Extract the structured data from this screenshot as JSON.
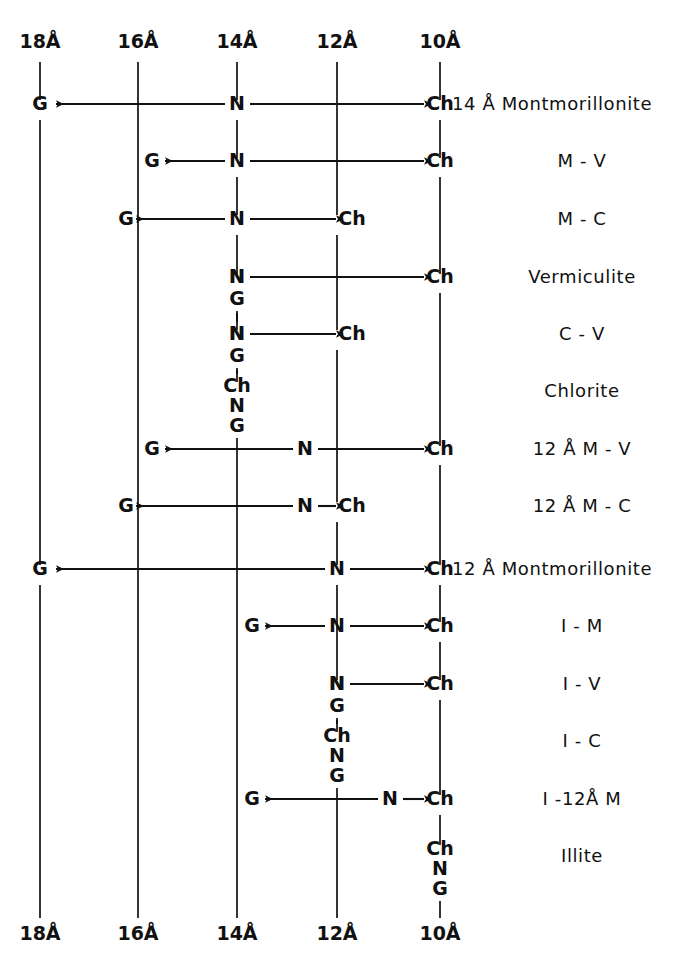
{
  "figure": {
    "background_color": "#ffffff",
    "ink_color": "#111111",
    "width": 687,
    "height": 972
  },
  "axis": {
    "name": "d-spacing columns",
    "top_labels": [
      "18Å",
      "16Å",
      "14Å",
      "12Å",
      "10Å"
    ],
    "bottom_labels": [
      "18Å",
      "16Å",
      "14Å",
      "12Å",
      "10Å"
    ],
    "column_x": [
      40,
      138,
      237,
      337,
      440
    ],
    "top_label_y": 48,
    "bottom_label_y": 940
  },
  "legend_keys": {
    "G": "Glycolated",
    "N": "Natural / air-dried",
    "Ch": "Heated (chlorite test)"
  },
  "rows": [
    {
      "id": "row-14a-montmorillonite",
      "label": "14 Å Montmorillonite",
      "label_x": 452,
      "label_anchor": "start",
      "y": 110,
      "nodes": [
        {
          "text": "G",
          "x": 40,
          "col": "18Å"
        },
        {
          "text": "N",
          "x": 237,
          "col": "14Å"
        },
        {
          "text": "Ch",
          "x": 440,
          "col": "10Å"
        }
      ],
      "arrows": [
        {
          "from_x": 225,
          "to_x": 56,
          "dir": "left"
        },
        {
          "from_x": 250,
          "to_x": 424,
          "dir": "right"
        }
      ]
    },
    {
      "id": "row-m-v",
      "label": "M - V",
      "label_x": 582,
      "label_anchor": "middle",
      "y": 167,
      "nodes": [
        {
          "text": "G",
          "x": 152,
          "col": "16Å"
        },
        {
          "text": "N",
          "x": 237,
          "col": "14Å"
        },
        {
          "text": "Ch",
          "x": 440,
          "col": "10Å"
        }
      ],
      "arrows": [
        {
          "from_x": 225,
          "to_x": 165,
          "dir": "left"
        },
        {
          "from_x": 250,
          "to_x": 424,
          "dir": "right"
        }
      ]
    },
    {
      "id": "row-m-c",
      "label": "M - C",
      "label_x": 582,
      "label_anchor": "middle",
      "y": 225,
      "nodes": [
        {
          "text": "G",
          "x": 126,
          "col": "16Å"
        },
        {
          "text": "N",
          "x": 237,
          "col": "14Å"
        },
        {
          "text": "Ch",
          "x": 352,
          "col": "12Å"
        }
      ],
      "arrows": [
        {
          "from_x": 225,
          "to_x": 136,
          "dir": "left"
        },
        {
          "from_x": 250,
          "to_x": 336,
          "dir": "right"
        }
      ]
    },
    {
      "id": "row-vermiculite",
      "label": "Vermiculite",
      "label_x": 582,
      "label_anchor": "middle",
      "y": 283,
      "nodes": [
        {
          "text": "N",
          "x": 237,
          "col": "14Å"
        },
        {
          "text": "Ch",
          "x": 440,
          "col": "10Å"
        }
      ],
      "arrows": [
        {
          "from_x": 250,
          "to_x": 424,
          "dir": "right"
        }
      ]
    },
    {
      "id": "row-c-v",
      "label": "C - V",
      "label_x": 582,
      "label_anchor": "middle",
      "y": 340,
      "nodes": [
        {
          "text": "N",
          "x": 237,
          "col": "14Å"
        },
        {
          "text": "Ch",
          "x": 352,
          "col": "12Å"
        }
      ],
      "arrows": [
        {
          "from_x": 250,
          "to_x": 336,
          "dir": "right"
        }
      ]
    },
    {
      "id": "row-chlorite",
      "label": "Chlorite",
      "label_x": 582,
      "label_anchor": "middle",
      "y": 397,
      "nodes": [],
      "arrows": []
    },
    {
      "id": "row-12a-m-v",
      "label": "12 Å  M - V",
      "label_x": 582,
      "label_anchor": "middle",
      "y": 455,
      "nodes": [
        {
          "text": "G",
          "x": 152,
          "col": "16Å"
        },
        {
          "text": "N",
          "x": 305,
          "col": "mid"
        },
        {
          "text": "Ch",
          "x": 440,
          "col": "10Å"
        }
      ],
      "arrows": [
        {
          "from_x": 293,
          "to_x": 165,
          "dir": "left"
        },
        {
          "from_x": 318,
          "to_x": 424,
          "dir": "right"
        }
      ]
    },
    {
      "id": "row-12a-m-c",
      "label": "12 Å  M - C",
      "label_x": 582,
      "label_anchor": "middle",
      "y": 512,
      "nodes": [
        {
          "text": "G",
          "x": 126,
          "col": "16Å"
        },
        {
          "text": "N",
          "x": 305,
          "col": "mid"
        },
        {
          "text": "Ch",
          "x": 352,
          "col": "12Å"
        }
      ],
      "arrows": [
        {
          "from_x": 293,
          "to_x": 136,
          "dir": "left"
        },
        {
          "from_x": 318,
          "to_x": 336,
          "dir": "right"
        }
      ]
    },
    {
      "id": "row-12a-montmorillonite",
      "label": "12 Å Montmorillonite",
      "label_x": 452,
      "label_anchor": "start",
      "y": 575,
      "nodes": [
        {
          "text": "G",
          "x": 40,
          "col": "18Å"
        },
        {
          "text": "N",
          "x": 337,
          "col": "12Å"
        },
        {
          "text": "Ch",
          "x": 440,
          "col": "10Å"
        }
      ],
      "arrows": [
        {
          "from_x": 325,
          "to_x": 56,
          "dir": "left"
        },
        {
          "from_x": 350,
          "to_x": 424,
          "dir": "right"
        }
      ]
    },
    {
      "id": "row-i-m",
      "label": "I - M",
      "label_x": 582,
      "label_anchor": "middle",
      "y": 632,
      "nodes": [
        {
          "text": "G",
          "x": 252,
          "col": "14Å"
        },
        {
          "text": "N",
          "x": 337,
          "col": "12Å"
        },
        {
          "text": "Ch",
          "x": 440,
          "col": "10Å"
        }
      ],
      "arrows": [
        {
          "from_x": 325,
          "to_x": 265,
          "dir": "left"
        },
        {
          "from_x": 350,
          "to_x": 424,
          "dir": "right"
        }
      ]
    },
    {
      "id": "row-i-v",
      "label": "I - V",
      "label_x": 582,
      "label_anchor": "middle",
      "y": 690,
      "nodes": [
        {
          "text": "N",
          "x": 337,
          "col": "12Å"
        },
        {
          "text": "Ch",
          "x": 440,
          "col": "10Å"
        }
      ],
      "arrows": [
        {
          "from_x": 350,
          "to_x": 424,
          "dir": "right"
        }
      ]
    },
    {
      "id": "row-i-c",
      "label": "I - C",
      "label_x": 582,
      "label_anchor": "middle",
      "y": 747,
      "nodes": [],
      "arrows": []
    },
    {
      "id": "row-i-12a-m",
      "label": "I -12Å  M",
      "label_x": 582,
      "label_anchor": "middle",
      "y": 805,
      "nodes": [
        {
          "text": "G",
          "x": 252,
          "col": "14Å"
        },
        {
          "text": "N",
          "x": 390,
          "col": "mid"
        },
        {
          "text": "Ch",
          "x": 440,
          "col": "10Å"
        }
      ],
      "arrows": [
        {
          "from_x": 378,
          "to_x": 265,
          "dir": "left"
        },
        {
          "from_x": 403,
          "to_x": 424,
          "dir": "right"
        }
      ]
    },
    {
      "id": "row-illite",
      "label": "Illite",
      "label_x": 582,
      "label_anchor": "middle",
      "y": 862,
      "nodes": [],
      "arrows": []
    }
  ],
  "stacks": [
    {
      "id": "stack-chlorite-14a",
      "column": "14Å",
      "x": 237,
      "items": [
        {
          "text": "N",
          "y": 283
        },
        {
          "text": "G",
          "y": 305
        },
        {
          "text": "N",
          "y": 340
        },
        {
          "text": "G",
          "y": 362
        },
        {
          "text": "Ch",
          "y": 392
        },
        {
          "text": "N",
          "y": 412
        },
        {
          "text": "G",
          "y": 432
        }
      ]
    },
    {
      "id": "stack-i-c-12a",
      "column": "12Å",
      "x": 337,
      "items": [
        {
          "text": "N",
          "y": 690
        },
        {
          "text": "G",
          "y": 712
        },
        {
          "text": "Ch",
          "y": 742
        },
        {
          "text": "N",
          "y": 762
        },
        {
          "text": "G",
          "y": 782
        }
      ]
    },
    {
      "id": "stack-illite-10a",
      "column": "10Å",
      "x": 440,
      "items": [
        {
          "text": "Ch",
          "y": 855
        },
        {
          "text": "N",
          "y": 875
        },
        {
          "text": "G",
          "y": 895
        }
      ]
    }
  ],
  "vertical_segments": [
    {
      "col": "18Å",
      "x": 40,
      "y1": 62,
      "y2": 100
    },
    {
      "col": "18Å",
      "x": 40,
      "y1": 120,
      "y2": 565
    },
    {
      "col": "18Å",
      "x": 40,
      "y1": 585,
      "y2": 918
    },
    {
      "col": "16Å",
      "x": 138,
      "y1": 62,
      "y2": 918
    },
    {
      "col": "14Å",
      "x": 237,
      "y1": 62,
      "y2": 100
    },
    {
      "col": "14Å",
      "x": 237,
      "y1": 120,
      "y2": 158
    },
    {
      "col": "14Å",
      "x": 237,
      "y1": 177,
      "y2": 215
    },
    {
      "col": "14Å",
      "x": 237,
      "y1": 235,
      "y2": 274
    },
    {
      "col": "14Å",
      "x": 237,
      "y1": 311,
      "y2": 330
    },
    {
      "col": "14Å",
      "x": 237,
      "y1": 368,
      "y2": 382
    },
    {
      "col": "14Å",
      "x": 237,
      "y1": 438,
      "y2": 918
    },
    {
      "col": "12Å",
      "x": 337,
      "y1": 62,
      "y2": 215
    },
    {
      "col": "12Å",
      "x": 337,
      "y1": 235,
      "y2": 330
    },
    {
      "col": "12Å",
      "x": 337,
      "y1": 350,
      "y2": 502
    },
    {
      "col": "12Å",
      "x": 337,
      "y1": 522,
      "y2": 565
    },
    {
      "col": "12Å",
      "x": 337,
      "y1": 585,
      "y2": 680
    },
    {
      "col": "12Å",
      "x": 337,
      "y1": 718,
      "y2": 732
    },
    {
      "col": "12Å",
      "x": 337,
      "y1": 788,
      "y2": 918
    },
    {
      "col": "10Å",
      "x": 440,
      "y1": 62,
      "y2": 100
    },
    {
      "col": "10Å",
      "x": 440,
      "y1": 120,
      "y2": 158
    },
    {
      "col": "10Å",
      "x": 440,
      "y1": 177,
      "y2": 274
    },
    {
      "col": "10Å",
      "x": 440,
      "y1": 293,
      "y2": 446
    },
    {
      "col": "10Å",
      "x": 440,
      "y1": 465,
      "y2": 565
    },
    {
      "col": "10Å",
      "x": 440,
      "y1": 585,
      "y2": 622
    },
    {
      "col": "10Å",
      "x": 440,
      "y1": 642,
      "y2": 680
    },
    {
      "col": "10Å",
      "x": 440,
      "y1": 700,
      "y2": 795
    },
    {
      "col": "10Å",
      "x": 440,
      "y1": 815,
      "y2": 845
    },
    {
      "col": "10Å",
      "x": 440,
      "y1": 901,
      "y2": 918
    }
  ]
}
